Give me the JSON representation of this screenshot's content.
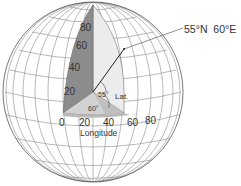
{
  "diagram": {
    "title_point": "55°N  60°E",
    "lat_label": "Lat.",
    "lat_angle": "55°",
    "lon_angle": "60°",
    "longitude_axis_label": "Longitude",
    "latitude_ticks": [
      "20",
      "40",
      "60",
      "80"
    ],
    "longitude_ticks": [
      "0",
      "20",
      "40",
      "60",
      "80"
    ],
    "colors": {
      "outline": "#555555",
      "grid": "#8a8a8a",
      "meridian_plane_dark": "#8c8c8c",
      "meridian_plane_light": "#ececec",
      "equator_plane": "#c8c8c8",
      "equator_wedge": "#dadada",
      "arrow": "#222222"
    }
  }
}
